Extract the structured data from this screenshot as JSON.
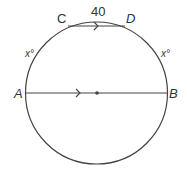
{
  "diagram": {
    "type": "circle-geometry",
    "points": {
      "A": "A",
      "B": "B",
      "C": "C",
      "D": "D"
    },
    "arc_CD_label": "40",
    "arc_AC_label": "x°",
    "arc_DB_label": "x°",
    "colors": {
      "stroke": "#444444",
      "text": "#333333"
    }
  }
}
